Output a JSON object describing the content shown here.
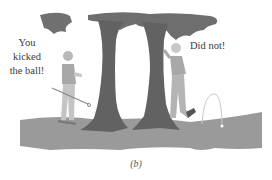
{
  "figure": {
    "label": "(b)",
    "speech_left": [
      "You",
      "kicked",
      "the ball!"
    ],
    "speech_right": "Did not!",
    "colors": {
      "ground": "#9a9a9a",
      "tree": "#6a6a6a",
      "foliage": "#707070",
      "shirt": "#a8a8a8",
      "pants": "#c4c4c4",
      "trajectory": "#c8c8c8",
      "text": "#3a3a3a"
    }
  }
}
